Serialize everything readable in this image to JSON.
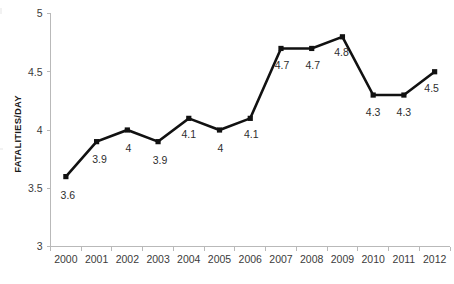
{
  "chart_data": {
    "type": "line",
    "title": "",
    "xlabel": "",
    "ylabel": "FATALITIES/DAY",
    "categories": [
      "2000",
      "2001",
      "2002",
      "2003",
      "2004",
      "2005",
      "2006",
      "2007",
      "2008",
      "2009",
      "2010",
      "2011",
      "2012"
    ],
    "values": [
      3.6,
      3.9,
      4,
      3.9,
      4.1,
      4,
      4.1,
      4.7,
      4.7,
      4.8,
      4.3,
      4.3,
      4.5
    ],
    "point_labels": [
      "3.6",
      "3.9",
      "4",
      "3.9",
      "4.1",
      "4",
      "4.1",
      "4.7",
      "4.7",
      "4.8",
      "4.3",
      "4.3",
      "4.5"
    ],
    "ylim": [
      3,
      5
    ],
    "yticks": [
      3,
      3.5,
      4,
      4.5,
      5
    ],
    "ytick_labels": [
      "3",
      "3.5",
      "4",
      "4.5",
      "5"
    ],
    "grid": false,
    "legend": false,
    "legend_position": "none",
    "series_color": "#111111",
    "marker": "square",
    "axis_color": "#b9b9b9"
  },
  "axis": {
    "y_title": "FATALITIES/DAY"
  }
}
